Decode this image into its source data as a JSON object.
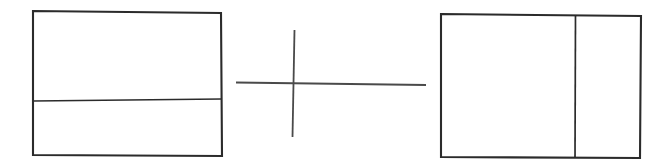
{
  "canvas": {
    "width": 664,
    "height": 167,
    "background_color": "#ffffff",
    "title": "Hand-drawn line diagram: two divided rectangles separated by a plus mark"
  },
  "style": {
    "stroke_color": "#2b2b2b",
    "stroke_color_light": "#4a4a4a",
    "outline_stroke_width": 2.1,
    "divider_stroke_width": 1.7,
    "cross_stroke_width": 1.8
  },
  "shapes": {
    "left_rectangle": {
      "label": "left-rectangle",
      "corners": {
        "top_left": [
          33,
          11
        ],
        "top_right": [
          221,
          13
        ],
        "bottom_right": [
          222,
          156
        ],
        "bottom_left": [
          33,
          155
        ]
      },
      "path": "M 33 11 L 221 13 L 222 156 L 33 155 Z",
      "divider": {
        "label": "horizontal-divider",
        "orientation": "horizontal",
        "path": "M 33 101 L 221.5 99",
        "from": [
          33,
          101
        ],
        "to": [
          221.5,
          99
        ]
      },
      "regions": [
        {
          "name": "upper-region",
          "approx_height": 90
        },
        {
          "name": "lower-region",
          "approx_height": 55
        }
      ]
    },
    "center_cross": {
      "label": "center-cross-mark",
      "vertical_line": {
        "label": "cross-vertical-line",
        "path": "M 294.5 30 L 292.5 137",
        "from": [
          294.5,
          30
        ],
        "to": [
          292.5,
          137
        ]
      },
      "horizontal_line": {
        "label": "cross-horizontal-line",
        "path": "M 236 82.5 L 426 85",
        "from": [
          236,
          82.5
        ],
        "to": [
          426,
          85
        ]
      },
      "intersection": [
        293.5,
        83.5
      ]
    },
    "right_rectangle": {
      "label": "right-rectangle",
      "corners": {
        "top_left": [
          441,
          14
        ],
        "top_right": [
          641,
          16
        ],
        "bottom_right": [
          640,
          158
        ],
        "bottom_left": [
          441,
          157
        ]
      },
      "path": "M 441 14 L 641 16 L 640 158 L 441 157 Z",
      "divider": {
        "label": "vertical-divider",
        "orientation": "vertical",
        "path": "M 575.5 15 L 575 157.5",
        "from": [
          575.5,
          15
        ],
        "to": [
          575,
          157.5
        ]
      },
      "regions": [
        {
          "name": "left-region",
          "approx_width": 134
        },
        {
          "name": "right-region",
          "approx_width": 65
        }
      ]
    }
  }
}
